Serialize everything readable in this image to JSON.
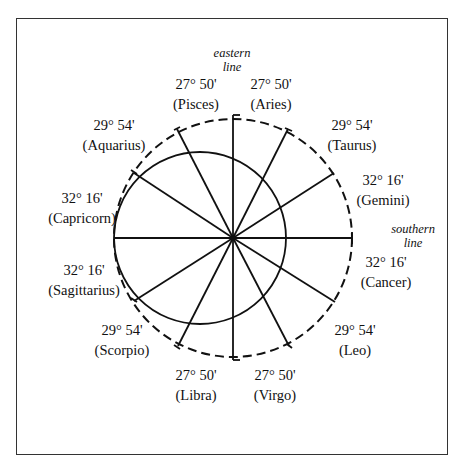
{
  "diagram": {
    "eastern_label": [
      "eastern",
      "line"
    ],
    "southern_label": [
      "southern",
      "line"
    ],
    "signs": [
      {
        "id": "pisces",
        "degree": "27° 50'",
        "name": "(Pisces)"
      },
      {
        "id": "aries",
        "degree": "27° 50'",
        "name": "(Aries)"
      },
      {
        "id": "taurus",
        "degree": "29° 54'",
        "name": "(Taurus)"
      },
      {
        "id": "gemini",
        "degree": "32° 16'",
        "name": "(Gemini)"
      },
      {
        "id": "cancer",
        "degree": "32° 16'",
        "name": "(Cancer)"
      },
      {
        "id": "leo",
        "degree": "29° 54'",
        "name": "(Leo)"
      },
      {
        "id": "virgo",
        "degree": "27° 50'",
        "name": "(Virgo)"
      },
      {
        "id": "libra",
        "degree": "27° 50'",
        "name": "(Libra)"
      },
      {
        "id": "scorpio",
        "degree": "29° 54'",
        "name": "(Scorpio)"
      },
      {
        "id": "sagittarius",
        "degree": "32° 16'",
        "name": "(Sagittarius)"
      },
      {
        "id": "capricorn",
        "degree": "32° 16'",
        "name": "(Capricorn)"
      },
      {
        "id": "aquarius",
        "degree": "29° 54'",
        "name": "(Aquarius)"
      }
    ],
    "colors": {
      "line": "#111111",
      "frame": "#333333",
      "background": "#ffffff"
    }
  }
}
